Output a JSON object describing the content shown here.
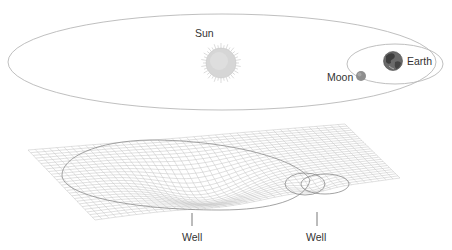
{
  "labels": {
    "sun": "Sun",
    "earth": "Earth",
    "moon": "Moon",
    "well_left": "Well",
    "well_right": "Well"
  },
  "colors": {
    "orbit_line": "#b5b5b5",
    "grid_line": "#c4c4c4",
    "well_outline": "#8a8a8a",
    "sun_fill": "#d9d9d9",
    "sun_rays": "#cfcfcf",
    "earth_fill": "#5a5a5a",
    "moon_fill": "#8c8c8c",
    "text": "#333333"
  },
  "icons": {
    "sun": "sun-icon",
    "earth": "earth-globe-icon",
    "moon": "moon-icon"
  }
}
